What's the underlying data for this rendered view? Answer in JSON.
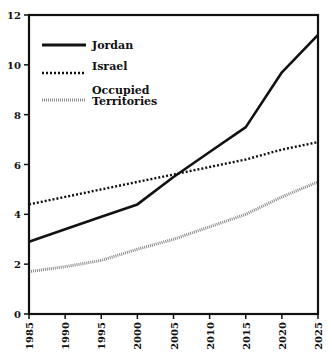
{
  "chart_data": {
    "type": "line",
    "title": "",
    "xlabel": "",
    "ylabel": "",
    "x": [
      1985,
      1990,
      1995,
      2000,
      2005,
      2010,
      2015,
      2020,
      2025
    ],
    "xlim": [
      1985,
      2025
    ],
    "ylim": [
      0,
      12
    ],
    "yticks": [
      0,
      2,
      4,
      6,
      8,
      10,
      12
    ],
    "grid": false,
    "legend_position": "upper left",
    "series": [
      {
        "name": "Jordan",
        "style": "solid",
        "color": "#111111",
        "values": [
          2.9,
          3.4,
          3.9,
          4.4,
          5.5,
          6.5,
          7.5,
          9.7,
          11.2
        ]
      },
      {
        "name": "Israel",
        "style": "dotted",
        "color": "#111111",
        "values": [
          4.4,
          4.7,
          5.0,
          5.3,
          5.6,
          5.9,
          6.2,
          6.6,
          6.9
        ]
      },
      {
        "name": "Occupied Territories",
        "style": "hatched-gray",
        "color": "#888888",
        "values": [
          1.7,
          1.9,
          2.15,
          2.6,
          3.0,
          3.5,
          4.0,
          4.7,
          5.3
        ]
      }
    ]
  },
  "legend": {
    "items": [
      {
        "label_lines": [
          "Jordan"
        ]
      },
      {
        "label_lines": [
          "Israel"
        ]
      },
      {
        "label_lines": [
          "Occupied",
          "Territories"
        ]
      }
    ]
  }
}
